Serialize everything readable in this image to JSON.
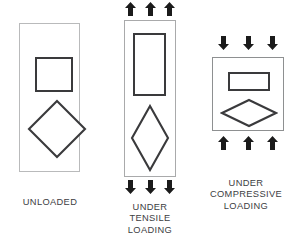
{
  "figure": {
    "background_color": "#ffffff",
    "outline_color": "#b9babb",
    "shape_color": "#3a3a3c",
    "arrow_color": "#1b1b1b",
    "text_color": "#3c3d3f"
  },
  "panels": [
    {
      "id": "unloaded",
      "caption": "UNLOADED",
      "specimen": {
        "shape": "rectangle",
        "orientation": "tall",
        "x": 19,
        "y": 23,
        "width": 61,
        "height": 149
      },
      "inner_shapes": [
        {
          "name": "square",
          "x": 35,
          "y": 57,
          "width": 38,
          "height": 35
        },
        {
          "name": "diamond",
          "x": 27,
          "y": 99,
          "width": 60,
          "height": 60
        }
      ],
      "arrows": {
        "top": 0,
        "bottom": 0,
        "direction": "none"
      }
    },
    {
      "id": "tensile",
      "caption": "UNDER\nTENSILE\nLOADING",
      "specimen": {
        "shape": "rectangle",
        "orientation": "tall-stretched",
        "x": 124,
        "y": 20,
        "width": 52,
        "height": 157
      },
      "inner_shapes": [
        {
          "name": "rectangle-elongated",
          "x": 133,
          "y": 33,
          "width": 33,
          "height": 63
        },
        {
          "name": "diamond-elongated",
          "x": 130,
          "y": 104,
          "width": 40,
          "height": 68
        }
      ],
      "arrows": {
        "top": 3,
        "bottom": 3,
        "direction": "outward",
        "meaning": "tension"
      }
    },
    {
      "id": "compressive",
      "caption": "UNDER\nCOMPRESSIVE\nLOADING",
      "specimen": {
        "shape": "rectangle",
        "orientation": "wide-flattened",
        "x": 212,
        "y": 57,
        "width": 72,
        "height": 74
      },
      "inner_shapes": [
        {
          "name": "rectangle-flattened",
          "x": 228,
          "y": 72,
          "width": 42,
          "height": 19
        },
        {
          "name": "diamond-flattened",
          "x": 220,
          "y": 98,
          "width": 58,
          "height": 30
        }
      ],
      "arrows": {
        "top": 3,
        "bottom": 3,
        "direction": "inward",
        "meaning": "compression"
      }
    }
  ],
  "icons": {
    "arrow_up": "arrow-up-icon",
    "arrow_down": "arrow-down-icon"
  }
}
